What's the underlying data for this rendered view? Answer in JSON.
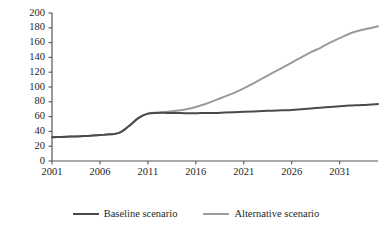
{
  "chart_data": {
    "type": "line",
    "title": "",
    "subtitle": "",
    "xlabel": "",
    "ylabel": "",
    "xlim": [
      2001,
      2035
    ],
    "ylim": [
      0,
      200
    ],
    "grid": false,
    "legend_position": "bottom",
    "y_ticks": [
      0,
      20,
      40,
      60,
      80,
      100,
      120,
      140,
      160,
      180,
      200
    ],
    "y_tick_labels": [
      "0",
      "20",
      "40",
      "60",
      "80",
      "100",
      "120",
      "140",
      "160",
      "180",
      "200"
    ],
    "x_ticks": [
      2001,
      2006,
      2011,
      2016,
      2021,
      2026,
      2031
    ],
    "x_tick_labels": [
      "2001",
      "2006",
      "2011",
      "2016",
      "2021",
      "2026",
      "2031"
    ],
    "x": [
      2001,
      2002,
      2003,
      2004,
      2005,
      2006,
      2007,
      2008,
      2009,
      2010,
      2011,
      2012,
      2013,
      2014,
      2015,
      2016,
      2017,
      2018,
      2019,
      2020,
      2021,
      2022,
      2023,
      2024,
      2025,
      2026,
      2027,
      2028,
      2029,
      2030,
      2031,
      2032,
      2033,
      2034,
      2035
    ],
    "series": [
      {
        "name": "Baseline scenario",
        "color": "#4a4a4a",
        "width": 2.0,
        "values": [
          32,
          32.5,
          33,
          33.5,
          34,
          35,
          36,
          38,
          47,
          58,
          64,
          65,
          65,
          65,
          64.5,
          64.5,
          65,
          65,
          65.5,
          66,
          66.5,
          67,
          67.5,
          68,
          68.5,
          69,
          70,
          71,
          72,
          73,
          74,
          75,
          75.5,
          76,
          77
        ]
      },
      {
        "name": "Alternative scenario",
        "color": "#9b9b9b",
        "width": 2.0,
        "values": [
          32,
          32.5,
          33,
          33.5,
          34,
          35,
          36,
          38,
          47,
          58,
          64,
          65.5,
          66.5,
          68,
          70,
          73,
          77,
          82,
          87,
          92,
          98,
          105,
          112,
          119,
          126,
          133,
          140,
          147,
          153,
          160,
          166,
          172,
          176,
          179,
          182
        ]
      }
    ],
    "legend": [
      {
        "label": "Baseline scenario",
        "color": "#4a4a4a"
      },
      {
        "label": "Alternative scenario",
        "color": "#9b9b9b"
      }
    ],
    "axis_color": "#555555"
  }
}
